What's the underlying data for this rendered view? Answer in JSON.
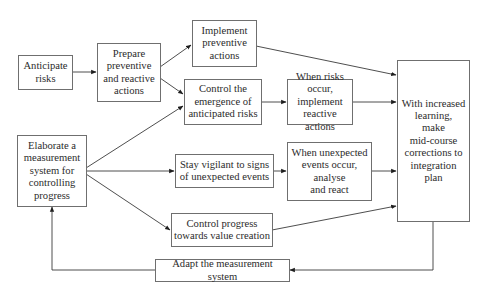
{
  "diagram": {
    "type": "flowchart",
    "nodes": {
      "anticipate": "Anticipate\nrisks",
      "prepare": "Prepare\npreventive\nand reactive\nactions",
      "implement_preventive": "Implement\npreventive\nactions",
      "control_emergence": "Control the\nemergence of\nanticipated risks",
      "risks_occur": "When risks occur,\nimplement\nreactive actions",
      "increased_learning": "With increased\nlearning,\nmake\nmid-course\ncorrections to\nintegration\nplan",
      "elaborate": "Elaborate a\nmeasurement\nsystem for\ncontrolling\nprogress",
      "stay_vigilant": "Stay vigilant to signs\nof unexpected events",
      "unexpected_occur": "When unexpected\nevents occur,\nanalyse\nand react",
      "control_progress": "Control progress\ntowards value creation",
      "adapt": "Adapt the measurement system"
    },
    "edges": [
      {
        "from": "anticipate",
        "to": "prepare"
      },
      {
        "from": "prepare",
        "to": "implement_preventive"
      },
      {
        "from": "prepare",
        "to": "control_emergence"
      },
      {
        "from": "elaborate",
        "to": "control_emergence"
      },
      {
        "from": "elaborate",
        "to": "stay_vigilant"
      },
      {
        "from": "elaborate",
        "to": "control_progress"
      },
      {
        "from": "implement_preventive",
        "to": "increased_learning"
      },
      {
        "from": "control_emergence",
        "to": "risks_occur"
      },
      {
        "from": "risks_occur",
        "to": "increased_learning"
      },
      {
        "from": "stay_vigilant",
        "to": "unexpected_occur"
      },
      {
        "from": "unexpected_occur",
        "to": "increased_learning"
      },
      {
        "from": "control_progress",
        "to": "increased_learning"
      },
      {
        "from": "increased_learning",
        "to": "adapt"
      },
      {
        "from": "adapt",
        "to": "elaborate"
      }
    ],
    "colors": {
      "line": "#3a3a3a",
      "border": "#6f6f6f",
      "text": "#2b2b2b",
      "background": "#ffffff"
    }
  }
}
